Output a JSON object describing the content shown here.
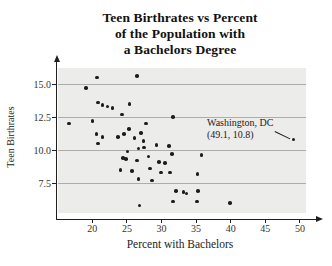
{
  "chart_data": {
    "type": "scatter",
    "title": "Teen Birthrates vs Percent of the Population with a Bachelors Degree",
    "title_lines": [
      "Teen Birthrates vs Percent",
      "of the Population with",
      "a Bachelors Degree"
    ],
    "xlabel": "Percent with Bachelors",
    "ylabel": "Teen Birthrates",
    "x_ticks": [
      20,
      25,
      30,
      35,
      40,
      45,
      50
    ],
    "y_ticks": [
      15.0,
      12.5,
      10.0,
      7.5
    ],
    "y_tick_labels": [
      "15.0",
      "12.5",
      "10.0",
      "7.5"
    ],
    "xlim": [
      15,
      52.5
    ],
    "ylim": [
      4.7,
      16.3
    ],
    "grid": "horizontal",
    "legend": "none",
    "annotation": {
      "line1": "Washington, DC",
      "line2": "(49.1, 10.8)",
      "target": [
        49.1,
        10.8
      ]
    },
    "points": [
      [
        20.7,
        15.5
      ],
      [
        26.5,
        15.6
      ],
      [
        19.1,
        14.7
      ],
      [
        20.8,
        13.6
      ],
      [
        21.5,
        13.4
      ],
      [
        22.2,
        13.3
      ],
      [
        22.9,
        13.2
      ],
      [
        25.4,
        13.5
      ],
      [
        24.3,
        12.7
      ],
      [
        16.6,
        12.0
      ],
      [
        20.0,
        12.2
      ],
      [
        31.7,
        12.5
      ],
      [
        27.8,
        12.0
      ],
      [
        25.3,
        11.6
      ],
      [
        20.6,
        11.2
      ],
      [
        21.5,
        11.0
      ],
      [
        23.7,
        11.0
      ],
      [
        24.6,
        11.2
      ],
      [
        26.1,
        10.9
      ],
      [
        27.0,
        11.3
      ],
      [
        27.4,
        10.7
      ],
      [
        20.8,
        10.5
      ],
      [
        29.3,
        10.4
      ],
      [
        31.1,
        10.3
      ],
      [
        27.5,
        10.2
      ],
      [
        26.7,
        10.1
      ],
      [
        25.1,
        9.9
      ],
      [
        31.5,
        9.7
      ],
      [
        28.1,
        9.5
      ],
      [
        24.4,
        9.4
      ],
      [
        24.9,
        9.3
      ],
      [
        26.5,
        9.2
      ],
      [
        29.6,
        9.1
      ],
      [
        30.5,
        9.0
      ],
      [
        35.8,
        9.6
      ],
      [
        24.1,
        8.5
      ],
      [
        25.7,
        8.4
      ],
      [
        28.3,
        8.6
      ],
      [
        29.9,
        8.3
      ],
      [
        31.2,
        8.3
      ],
      [
        35.2,
        8.2
      ],
      [
        26.7,
        7.8
      ],
      [
        28.6,
        7.7
      ],
      [
        32.1,
        6.9
      ],
      [
        33.2,
        6.8
      ],
      [
        33.6,
        6.7
      ],
      [
        35.3,
        6.9
      ],
      [
        31.7,
        6.1
      ],
      [
        35.1,
        6.1
      ],
      [
        39.9,
        6.0
      ],
      [
        26.8,
        5.8
      ],
      [
        49.1,
        10.8
      ]
    ],
    "colors": {
      "point": "#1c1c1c",
      "plot_background": "#ececea",
      "gridline": "#adadaa",
      "axis": "#1f1f1f",
      "title_text": "#111111",
      "label_text": "#222222"
    }
  }
}
